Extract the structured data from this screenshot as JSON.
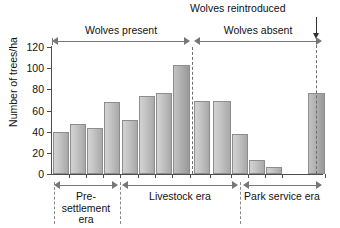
{
  "chart_data": {
    "type": "bar",
    "title": "",
    "xlabel": "",
    "ylabel": "Number of trees/ha",
    "ylim": [
      0,
      120
    ],
    "yticks": [
      0,
      20,
      40,
      60,
      80,
      100,
      120
    ],
    "grid": false,
    "legend": "none",
    "categories": [
      "1",
      "2",
      "3",
      "4",
      "5",
      "6",
      "7",
      "8",
      "9",
      "10",
      "11",
      "12",
      "13",
      "14"
    ],
    "values": [
      40,
      47,
      43,
      68,
      51,
      74,
      77,
      103,
      69,
      69,
      38,
      13,
      7,
      77
    ],
    "annotations": [
      {
        "text": "Wolves reintroduced",
        "type": "arrow-down-label",
        "target_bar_index": 13
      }
    ],
    "top_spans": [
      {
        "label": "Wolves present",
        "from_bar": 0,
        "to_bar": 7
      },
      {
        "label": "Wolves absent",
        "from_bar": 8,
        "to_bar": 13
      }
    ],
    "bottom_spans": [
      {
        "label": "Pre-settlement era",
        "from_bar": 0,
        "to_bar": 3
      },
      {
        "label": "Livestock era",
        "from_bar": 4,
        "to_bar": 9
      },
      {
        "label": "Park service era",
        "from_bar": 10,
        "to_bar": 13
      }
    ],
    "colors": {
      "bar_fill": "#c6c6c6",
      "bar_edge": "#8d8d8d",
      "axis": "#4d4d4d",
      "dash": "#6e6e6e",
      "text": "#111111"
    }
  },
  "axis": {
    "y_label": "Number of trees/ha",
    "ticks": [
      "120",
      "100",
      "80",
      "60",
      "40",
      "20",
      "0"
    ]
  },
  "spans": {
    "wolves_present": "Wolves present",
    "wolves_absent": "Wolves absent"
  },
  "eras": {
    "pre_settlement_line1": "Pre-",
    "pre_settlement_line2": "settlement",
    "pre_settlement_line3": "era",
    "livestock": "Livestock era",
    "park_service": "Park service era"
  },
  "annotation": {
    "wolves_reintroduced": "Wolves reintroduced"
  }
}
